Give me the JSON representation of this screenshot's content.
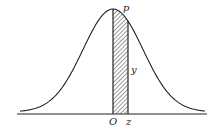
{
  "diagram": {
    "type": "normal-distribution-curve",
    "labels": {
      "peak_point": "p",
      "ordinate": "y",
      "origin": "O",
      "z_value": "z"
    },
    "shaded_region": "area under curve between O and z (hatched)",
    "colors": {
      "line": "#222222",
      "background": "#ffffff"
    }
  }
}
